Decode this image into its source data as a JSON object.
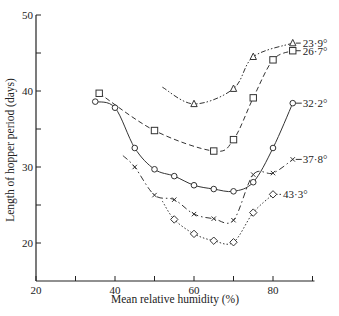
{
  "chart_data": {
    "type": "line",
    "title": "",
    "xlabel": "Mean relative humidity (%)",
    "ylabel": "Length of hopper period (days)",
    "xlim": [
      20,
      90
    ],
    "ylim": [
      15,
      50
    ],
    "x_ticks": [
      20,
      30,
      40,
      50,
      60,
      70,
      80,
      90
    ],
    "x_tick_labels": [
      "20",
      "40",
      "60",
      "80"
    ],
    "y_ticks": [
      20,
      25,
      30,
      35,
      40,
      45,
      50
    ],
    "y_tick_labels": [
      "20",
      "30",
      "40",
      "50"
    ],
    "grid": false,
    "legend_position": "inline labels at right end of curves",
    "series": [
      {
        "name": "23·9°",
        "marker": "triangle",
        "line": "dash-dot-dot",
        "x": [
          60,
          70,
          75,
          85
        ],
        "y": [
          38.3,
          40.3,
          44.5,
          46.3
        ]
      },
      {
        "name": "26·7°",
        "marker": "square",
        "line": "dashed",
        "x": [
          36,
          50,
          65,
          70,
          75,
          80,
          85
        ],
        "y": [
          39.7,
          34.8,
          32.1,
          33.6,
          39.1,
          44.1,
          45.3
        ]
      },
      {
        "name": "32·2°",
        "marker": "circle",
        "line": "solid",
        "x": [
          35,
          40,
          45,
          50,
          55,
          60,
          65,
          70,
          75,
          80,
          85
        ],
        "y": [
          38.6,
          37.8,
          32.5,
          29.7,
          28.8,
          27.6,
          27.1,
          26.8,
          28.0,
          32.5,
          38.4
        ]
      },
      {
        "name": "37·8°",
        "marker": "cross",
        "line": "dash-dot",
        "x": [
          45,
          50,
          55,
          60,
          65,
          70,
          75,
          80,
          85
        ],
        "y": [
          30.0,
          26.3,
          25.7,
          23.8,
          23.2,
          23.0,
          29.0,
          29.2,
          31.0
        ]
      },
      {
        "name": "43·3°",
        "marker": "diamond",
        "line": "dotted",
        "x": [
          55,
          60,
          65,
          70,
          75,
          80
        ],
        "y": [
          23.1,
          21.2,
          20.3,
          20.1,
          24.0,
          26.4
        ]
      }
    ]
  }
}
